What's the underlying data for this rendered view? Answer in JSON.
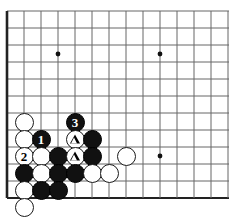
{
  "diagram": {
    "kind": "go-board-diagram",
    "board": {
      "origin_x": 7,
      "origin_y": 11,
      "spacing": 17,
      "cols": 14,
      "rows": 12,
      "line_color": "#666666",
      "edge_color": "#222222",
      "background": "#ffffff",
      "star_points": [
        {
          "cx": 58,
          "cy": 54
        },
        {
          "cx": 160,
          "cy": 54
        },
        {
          "cx": 160,
          "cy": 156
        }
      ]
    },
    "stone_radius": 9.5,
    "stones": [
      {
        "id": "w-a",
        "color": "white",
        "cx": 24,
        "cy": 122,
        "label": "",
        "mark": ""
      },
      {
        "id": "w-b",
        "color": "white",
        "cx": 24,
        "cy": 139,
        "label": "",
        "mark": ""
      },
      {
        "id": "b-move1",
        "color": "black",
        "cx": 41,
        "cy": 139,
        "label": "1",
        "mark": ""
      },
      {
        "id": "b-move3",
        "color": "black",
        "cx": 75,
        "cy": 122,
        "label": "3",
        "mark": ""
      },
      {
        "id": "w-tri1",
        "color": "white",
        "cx": 75,
        "cy": 139,
        "label": "",
        "mark": "triangle"
      },
      {
        "id": "b-c",
        "color": "black",
        "cx": 92,
        "cy": 139,
        "label": "",
        "mark": ""
      },
      {
        "id": "w-move2",
        "color": "white",
        "cx": 24,
        "cy": 156,
        "label": "2",
        "mark": ""
      },
      {
        "id": "w-c",
        "color": "white",
        "cx": 41,
        "cy": 156,
        "label": "",
        "mark": ""
      },
      {
        "id": "b-d",
        "color": "black",
        "cx": 58,
        "cy": 156,
        "label": "",
        "mark": ""
      },
      {
        "id": "w-tri2",
        "color": "white",
        "cx": 75,
        "cy": 156,
        "label": "",
        "mark": "triangle"
      },
      {
        "id": "b-e",
        "color": "black",
        "cx": 92,
        "cy": 156,
        "label": "",
        "mark": ""
      },
      {
        "id": "w-right",
        "color": "white",
        "cx": 126,
        "cy": 156,
        "label": "",
        "mark": ""
      },
      {
        "id": "b-f",
        "color": "black",
        "cx": 24,
        "cy": 173,
        "label": "",
        "mark": ""
      },
      {
        "id": "w-d",
        "color": "white",
        "cx": 41,
        "cy": 173,
        "label": "",
        "mark": ""
      },
      {
        "id": "b-g",
        "color": "black",
        "cx": 58,
        "cy": 173,
        "label": "",
        "mark": ""
      },
      {
        "id": "b-h",
        "color": "black",
        "cx": 75,
        "cy": 173,
        "label": "",
        "mark": ""
      },
      {
        "id": "w-e",
        "color": "white",
        "cx": 92,
        "cy": 173,
        "label": "",
        "mark": ""
      },
      {
        "id": "w-f",
        "color": "white",
        "cx": 109,
        "cy": 173,
        "label": "",
        "mark": ""
      },
      {
        "id": "w-g",
        "color": "white",
        "cx": 24,
        "cy": 190,
        "label": "",
        "mark": ""
      },
      {
        "id": "b-i",
        "color": "black",
        "cx": 41,
        "cy": 190,
        "label": "",
        "mark": ""
      },
      {
        "id": "b-j",
        "color": "black",
        "cx": 58,
        "cy": 190,
        "label": "",
        "mark": ""
      },
      {
        "id": "w-h",
        "color": "white",
        "cx": 24,
        "cy": 207,
        "label": "",
        "mark": ""
      }
    ]
  }
}
